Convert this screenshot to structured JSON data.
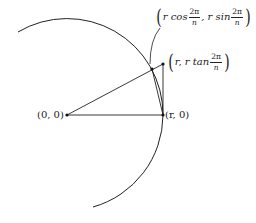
{
  "diagram": {
    "type": "geometry",
    "colors": {
      "line": "#222222",
      "background": "#ffffff"
    },
    "points": {
      "origin": {
        "label": "(0, 0)"
      },
      "r0": {
        "label": "(r, 0)"
      },
      "on_circle": {
        "prefix": "r cos",
        "frac_num": "2π",
        "frac_den": "n",
        "mid": ", r sin",
        "frac2_num": "2π",
        "frac2_den": "n"
      },
      "tangent": {
        "prefix": "r, r tan",
        "frac_num": "2π",
        "frac_den": "n"
      }
    },
    "parens": {
      "open": "(",
      "close": ")"
    }
  }
}
